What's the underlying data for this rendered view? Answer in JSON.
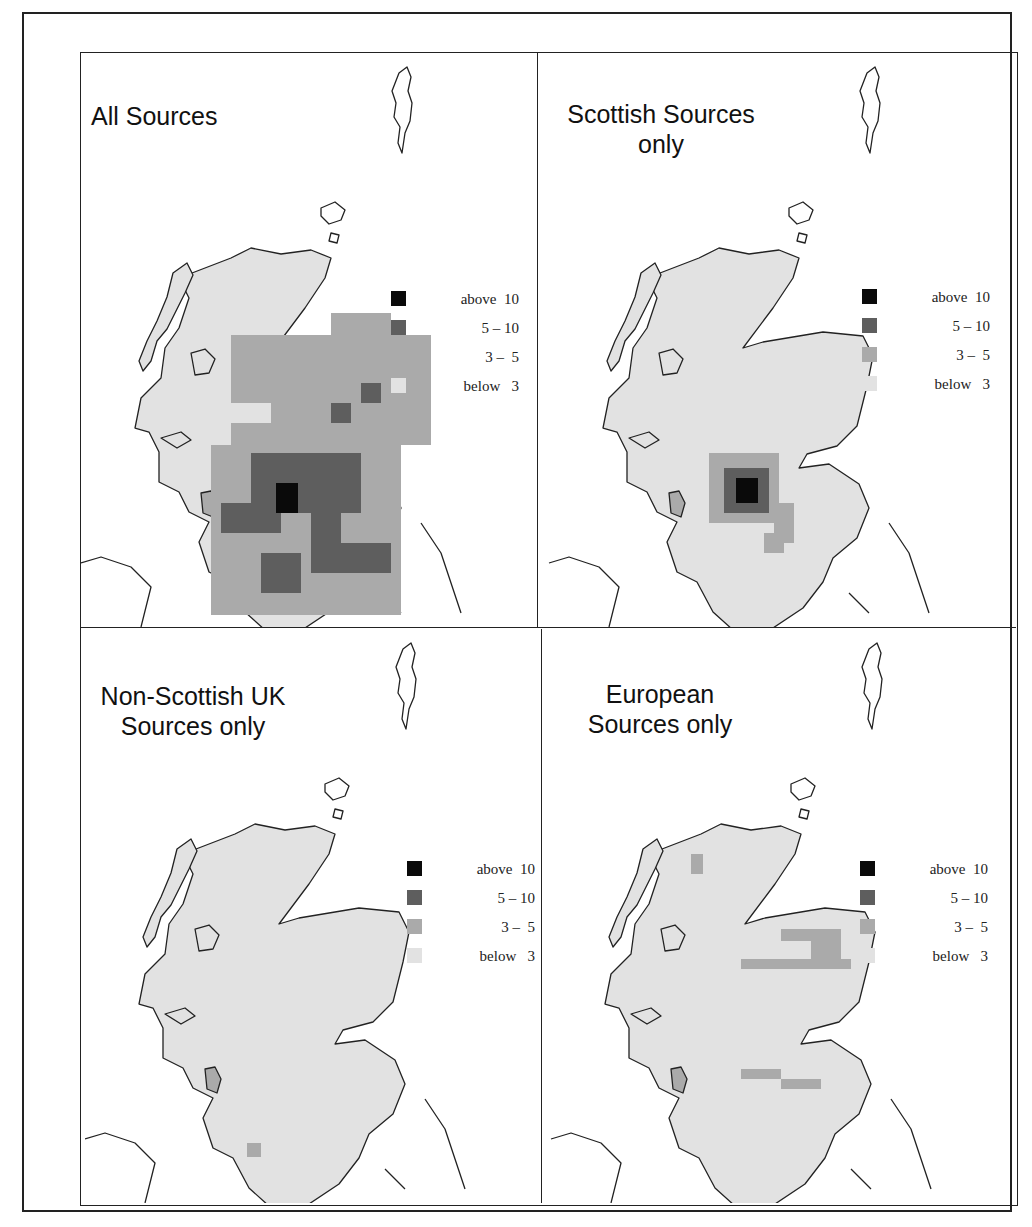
{
  "figure": {
    "panels": [
      {
        "title": "All Sources",
        "title_lines": [
          "All Sources"
        ]
      },
      {
        "title": "Scottish Sources only",
        "title_lines": [
          "Scottish Sources",
          "only"
        ]
      },
      {
        "title": "Non-Scottish UK Sources only",
        "title_lines": [
          "Non-Scottish UK",
          "Sources only"
        ]
      },
      {
        "title": "European Sources only",
        "title_lines": [
          "European",
          "Sources only"
        ]
      }
    ],
    "legend": {
      "items": [
        {
          "label": "above  10",
          "color": "#0a0a0a"
        },
        {
          "label": "5 – 10",
          "color": "#5e5e5e"
        },
        {
          "label": "3 –  5",
          "color": "#aaaaaa"
        },
        {
          "label": "below   3",
          "color": "#e2e2e2"
        }
      ]
    }
  }
}
